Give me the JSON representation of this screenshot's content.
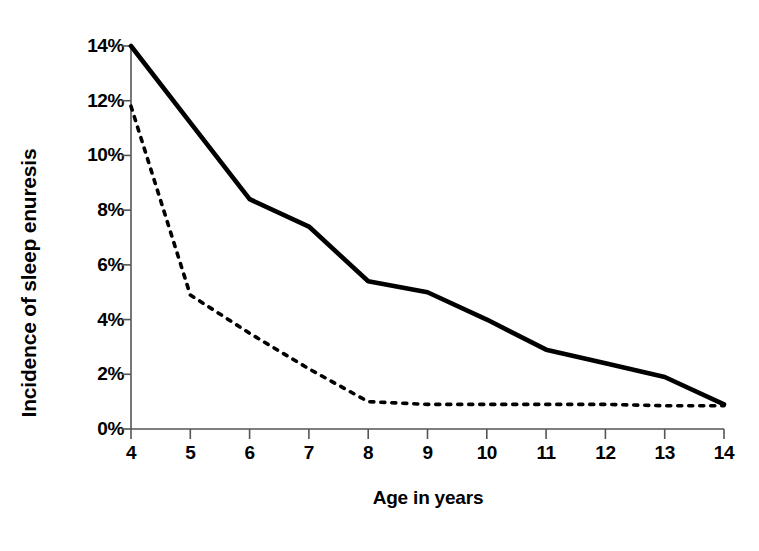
{
  "chart_data": {
    "type": "line",
    "title": "",
    "xlabel": "Age in years",
    "ylabel": "Incidence of sleep enuresis",
    "x": [
      4,
      5,
      6,
      7,
      8,
      9,
      10,
      11,
      12,
      13,
      14
    ],
    "xtick_labels": [
      "4",
      "5",
      "6",
      "7",
      "8",
      "9",
      "10",
      "11",
      "12",
      "13",
      "14"
    ],
    "ytick_labels": [
      "0%",
      "2%",
      "4%",
      "6%",
      "8%",
      "10%",
      "12%",
      "14%"
    ],
    "ytick_values": [
      0,
      2,
      4,
      6,
      8,
      10,
      12,
      14
    ],
    "xlim": [
      4,
      14
    ],
    "ylim": [
      0,
      14
    ],
    "grid": false,
    "legend": "none",
    "series": [
      {
        "name": "solid-series",
        "style": "solid",
        "color": "#000000",
        "values": [
          14.0,
          11.2,
          8.4,
          7.4,
          5.4,
          5.0,
          4.0,
          2.9,
          2.4,
          1.9,
          0.9
        ]
      },
      {
        "name": "dashed-series",
        "style": "dashed",
        "color": "#000000",
        "values": [
          11.8,
          4.9,
          3.5,
          2.2,
          1.0,
          0.9,
          0.9,
          0.9,
          0.9,
          0.85,
          0.85
        ]
      }
    ]
  },
  "axes": {
    "y_title": "Incidence of sleep enuresis",
    "x_title": "Age in years"
  }
}
